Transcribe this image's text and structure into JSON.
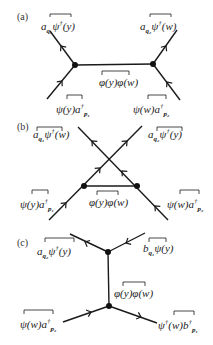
{
  "diagrams": [
    {
      "tag": "(a)",
      "labels": {
        "top_left": "a_{q1} ψ†(y)",
        "top_right": "a_{q2} ψ†(w)",
        "propagator": "φ(y)φ(w)",
        "bottom_left": "ψ(y) a†_{p1}",
        "bottom_right": "ψ(w) a†_{p2}"
      }
    },
    {
      "tag": "(b)",
      "labels": {
        "top_left": "a_{q1} ψ†(w)",
        "top_right": "a_{q2} ψ†(y)",
        "propagator": "φ(y)φ(w)",
        "bottom_left": "ψ(y) a†_{p1}",
        "bottom_right": "ψ(w) a†_{p2}"
      }
    },
    {
      "tag": "(c)",
      "labels": {
        "top_left": "a_{q2} ψ†(y)",
        "top_right": "b_{q1} ψ(y)",
        "propagator": "φ(y)φ(w)",
        "bottom_left": "ψ(w) a†_{p2}",
        "bottom_right": "ψ†(w) b†_{p1}"
      }
    }
  ],
  "text": {
    "a_tag": "(a)",
    "b_tag": "(b)",
    "c_tag": "(c)",
    "a_tl_base": "a",
    "a_tl_sub": "q₁",
    "a_tl_rest": "ψ",
    "a_tl_sup": "†",
    "a_tl_arg": "(y)",
    "a_tr_base": "a",
    "a_tr_sub": "q₂",
    "a_tr_rest": "ψ",
    "a_tr_sup": "†",
    "a_tr_arg": "(w)",
    "a_prop": "φ(y)φ(w)",
    "a_bl_main": "ψ(y)a",
    "a_bl_sup": "†",
    "a_bl_sub": "p₁",
    "a_br_main": "ψ(w)a",
    "a_br_sup": "†",
    "a_br_sub": "p₂",
    "b_tl_base": "a",
    "b_tl_sub": "q₁",
    "b_tl_rest": "ψ",
    "b_tl_sup": "†",
    "b_tl_arg": "(w)",
    "b_tr_base": "a",
    "b_tr_sub": "q₂",
    "b_tr_rest": "ψ",
    "b_tr_sup": "†",
    "b_tr_arg": "(y)",
    "b_prop": "φ(y)φ(w)",
    "b_bl_main": "ψ(y)a",
    "b_bl_sup": "†",
    "b_bl_sub": "p₁",
    "b_br_main": "ψ(w)a",
    "b_br_sup": "†",
    "b_br_sub": "p₂",
    "c_tl_base": "a",
    "c_tl_sub": "q₂",
    "c_tl_rest": "ψ",
    "c_tl_sup": "†",
    "c_tl_arg": "(y)",
    "c_tr_base": "b",
    "c_tr_sub": "q₁",
    "c_tr_rest": "ψ(y)",
    "c_prop": "φ(y)φ(w)",
    "c_bl_main": "ψ(w)a",
    "c_bl_sup": "†",
    "c_bl_sub": "p₂",
    "c_br_main": "ψ",
    "c_br_sup": "†",
    "c_br_mid": "(w)b",
    "c_br_sup2": "†",
    "c_br_sub": "p₁"
  },
  "colors": {
    "line": "#1a1a1a",
    "text": "#222222",
    "background": "#ffffff"
  }
}
